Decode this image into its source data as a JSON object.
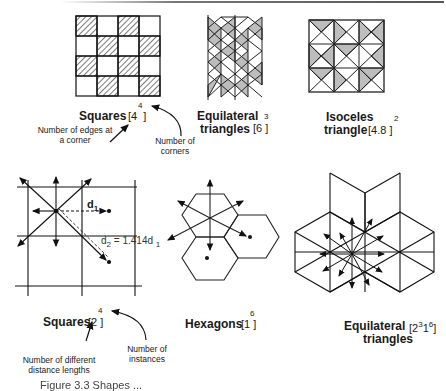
{
  "figure": {
    "top_row": [
      {
        "name": "Squares",
        "notation_base": "[4",
        "notation_sup": "4",
        "notation_close": "]",
        "annotation_left": "Number of edges at a corner",
        "annotation_right": "Number of corners"
      },
      {
        "name_line1": "Equilateral",
        "name_line2": "triangles",
        "notation_base": "[6",
        "notation_sup": "3",
        "notation_close": "]"
      },
      {
        "name_line1": "Isoceles",
        "name_line2": "triangle",
        "notation_base": "[4.8",
        "notation_sup": "2",
        "notation_close": "]"
      }
    ],
    "bottom_row": [
      {
        "name": "Squares",
        "notation_base": "[2",
        "notation_sup": "4",
        "notation_close": "]",
        "d1_label": "d",
        "d1_sub": "1",
        "d2_label": "d",
        "d2_sub": "2",
        "d2_eq": "= 1.414d",
        "d2_eq_sub": "1",
        "annotation_left": "Number of different distance lengths",
        "annotation_right": "Number of instances"
      },
      {
        "name": "Hexagons",
        "notation_base": "[1",
        "notation_sup": "6",
        "notation_close": "]"
      },
      {
        "name_line1": "Equilateral",
        "name_line2": "triangles",
        "notation_base": "[2",
        "notation_sup": "3",
        "notation_mid": "1",
        "notation_sup2": "6",
        "notation_close": "]"
      }
    ],
    "caption": "Figure 3.3 Shapes ..."
  }
}
